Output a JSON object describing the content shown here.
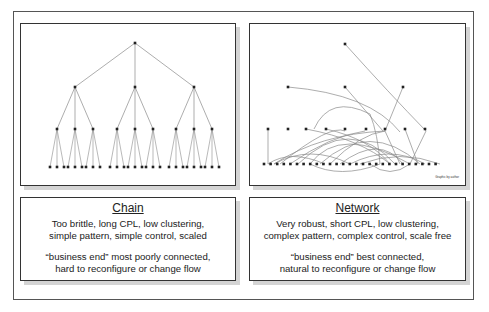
{
  "panels": {
    "chain": {
      "title": "Chain",
      "line1": "Too brittle, long CPL, low clustering,",
      "line2": "simple pattern, simple control, scaled",
      "line3": "“business end” most poorly connected,",
      "line4": "hard to reconfigure or change flow"
    },
    "network": {
      "title": "Network",
      "line1": "Very robust, short CPL, low clustering,",
      "line2": "complex pattern, complex control, scale free",
      "line3": "“business end”  best connected,",
      "line4": "natural to reconfigure or change flow",
      "credit": "Graphic by author"
    }
  },
  "colors": {
    "edge": "#8a8a8a",
    "node": "#222222",
    "frame": "#333333"
  }
}
